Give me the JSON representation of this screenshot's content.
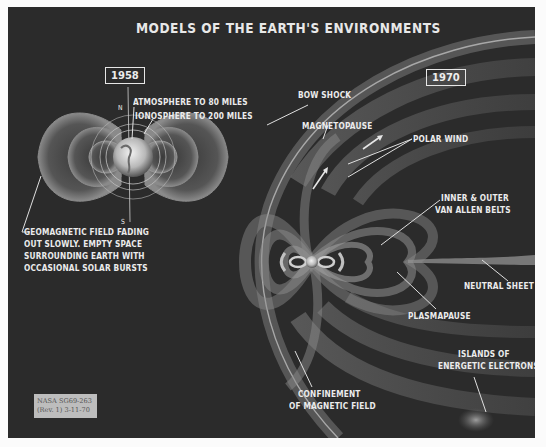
{
  "title": "MODELS OF THE EARTH'S ENVIRONMENTS",
  "left_panel": {
    "year": "1958",
    "labels": {
      "atmosphere": "ATMOSPHERE TO 80 MILES",
      "ionosphere": "IONOSPHERE TO 200 MILES",
      "north": "N",
      "south": "S",
      "geomagnetic": [
        "GEOMAGNETIC FIELD FADING",
        "OUT SLOWLY. EMPTY SPACE",
        "SURROUNDING EARTH WITH",
        "OCCASIONAL SOLAR BURSTS"
      ]
    }
  },
  "right_panel": {
    "year": "1970",
    "labels": {
      "bow_shock": "BOW SHOCK",
      "magnetopause": "MAGNETOPAUSE",
      "polar_wind": "POLAR WIND",
      "van_allen": [
        "INNER & OUTER",
        "VAN ALLEN BELTS"
      ],
      "neutral_sheet": "NEUTRAL SHEET",
      "plasmapause": "PLASMAPAUSE",
      "islands": [
        "ISLANDS OF",
        "ENERGETIC ELECTRONS"
      ],
      "confinement": [
        "CONFINEMENT",
        "OF MAGNETIC FIELD"
      ]
    }
  },
  "stamp": {
    "line1": "NASA SG69-263",
    "line2": "(Rev. 1) 3-11-70"
  },
  "colors": {
    "background": "#2b2b2b",
    "text": "#ececec",
    "field_glow": "#9a9a9a"
  }
}
